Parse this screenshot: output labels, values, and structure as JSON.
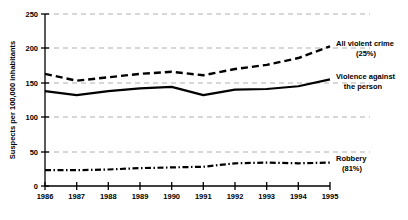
{
  "chart_data": {
    "type": "line",
    "title": "",
    "subtitle": "",
    "xlabel": "",
    "ylabel": "Suspects per 100,000 inhabitants",
    "x": [
      1986,
      1987,
      1988,
      1989,
      1990,
      1991,
      1992,
      1993,
      1994,
      1995
    ],
    "xtick_labels": [
      "1986",
      "1987",
      "1988",
      "1989",
      "1990",
      "1991",
      "1992",
      "1993",
      "1994",
      "1995"
    ],
    "ytick_labels": [
      "0",
      "50",
      "100",
      "150",
      "200",
      "250"
    ],
    "yticks": [
      0,
      50,
      100,
      150,
      200,
      250
    ],
    "ylim": [
      0,
      250
    ],
    "xlim": [
      1986,
      1995
    ],
    "grid": "horizontal-dashed",
    "grid_color": "#b0b0b0",
    "legend_position": "right-of-plot-inline",
    "line_color": "#000000",
    "series": [
      {
        "name": "All violent crime",
        "label_line1": "All violent crime",
        "label_line2": "(25%)",
        "style": "dashed",
        "values": [
          163,
          153,
          158,
          163,
          166,
          161,
          170,
          176,
          186,
          203
        ]
      },
      {
        "name": "Violence against the person",
        "label_line1": "Violence against",
        "label_line2": "the person",
        "style": "solid",
        "values": [
          138,
          132,
          138,
          142,
          144,
          132,
          140,
          141,
          145,
          155
        ]
      },
      {
        "name": "Robbery",
        "label_line1": "Robbery",
        "label_line2": "(81%)",
        "style": "dash-dot",
        "values": [
          23,
          23,
          24,
          26,
          27,
          28,
          33,
          34,
          33,
          34
        ]
      }
    ]
  }
}
